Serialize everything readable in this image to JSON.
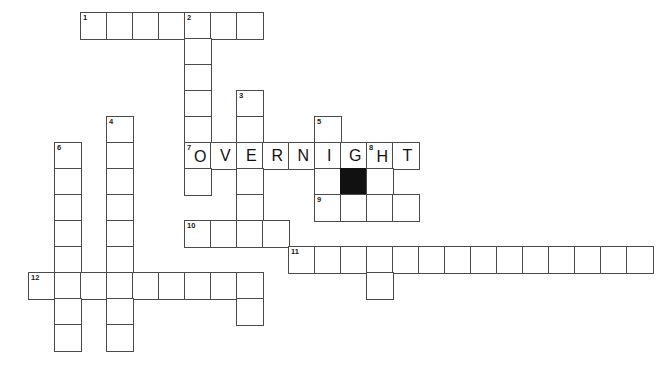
{
  "puzzle": {
    "title": "Crossword Grid",
    "cell_size": 26,
    "origin_x": 28,
    "origin_y": 12,
    "grid_cols": 24,
    "grid_rows": 14,
    "background_color": "#ffffff",
    "line_color": "#4a4a4a",
    "block_color": "#111111",
    "filled_answer": "OVERNIGHT",
    "cells": [
      {
        "c": 2,
        "r": 0,
        "num": "1",
        "letter": ""
      },
      {
        "c": 3,
        "r": 0,
        "num": "",
        "letter": ""
      },
      {
        "c": 4,
        "r": 0,
        "num": "",
        "letter": ""
      },
      {
        "c": 5,
        "r": 0,
        "num": "",
        "letter": ""
      },
      {
        "c": 6,
        "r": 0,
        "num": "2",
        "letter": ""
      },
      {
        "c": 7,
        "r": 0,
        "num": "",
        "letter": ""
      },
      {
        "c": 8,
        "r": 0,
        "num": "",
        "letter": ""
      },
      {
        "c": 6,
        "r": 1,
        "num": "",
        "letter": ""
      },
      {
        "c": 6,
        "r": 2,
        "num": "",
        "letter": ""
      },
      {
        "c": 8,
        "r": 3,
        "num": "3",
        "letter": ""
      },
      {
        "c": 6,
        "r": 3,
        "num": "",
        "letter": ""
      },
      {
        "c": 3,
        "r": 4,
        "num": "4",
        "letter": ""
      },
      {
        "c": 6,
        "r": 4,
        "num": "",
        "letter": ""
      },
      {
        "c": 8,
        "r": 4,
        "num": "",
        "letter": ""
      },
      {
        "c": 11,
        "r": 4,
        "num": "5",
        "letter": ""
      },
      {
        "c": 1,
        "r": 5,
        "num": "6",
        "letter": ""
      },
      {
        "c": 3,
        "r": 5,
        "num": "",
        "letter": ""
      },
      {
        "c": 6,
        "r": 5,
        "num": "7",
        "letter": "O"
      },
      {
        "c": 7,
        "r": 5,
        "num": "",
        "letter": "V"
      },
      {
        "c": 8,
        "r": 5,
        "num": "",
        "letter": "E"
      },
      {
        "c": 9,
        "r": 5,
        "num": "",
        "letter": "R"
      },
      {
        "c": 10,
        "r": 5,
        "num": "",
        "letter": "N"
      },
      {
        "c": 11,
        "r": 5,
        "num": "",
        "letter": "I"
      },
      {
        "c": 12,
        "r": 5,
        "num": "",
        "letter": "G"
      },
      {
        "c": 13,
        "r": 5,
        "num": "8",
        "letter": "H"
      },
      {
        "c": 14,
        "r": 5,
        "num": "",
        "letter": "T"
      },
      {
        "c": 1,
        "r": 6,
        "num": "",
        "letter": ""
      },
      {
        "c": 3,
        "r": 6,
        "num": "",
        "letter": ""
      },
      {
        "c": 6,
        "r": 6,
        "num": "",
        "letter": ""
      },
      {
        "c": 8,
        "r": 6,
        "num": "",
        "letter": ""
      },
      {
        "c": 11,
        "r": 6,
        "num": "",
        "letter": ""
      },
      {
        "c": 12,
        "r": 6,
        "num": "",
        "letter": "",
        "black": true
      },
      {
        "c": 13,
        "r": 6,
        "num": "",
        "letter": ""
      },
      {
        "c": 1,
        "r": 7,
        "num": "",
        "letter": ""
      },
      {
        "c": 3,
        "r": 7,
        "num": "",
        "letter": ""
      },
      {
        "c": 8,
        "r": 7,
        "num": "",
        "letter": ""
      },
      {
        "c": 11,
        "r": 7,
        "num": "9",
        "letter": ""
      },
      {
        "c": 12,
        "r": 7,
        "num": "",
        "letter": ""
      },
      {
        "c": 13,
        "r": 7,
        "num": "",
        "letter": ""
      },
      {
        "c": 14,
        "r": 7,
        "num": "",
        "letter": ""
      },
      {
        "c": 1,
        "r": 8,
        "num": "",
        "letter": ""
      },
      {
        "c": 3,
        "r": 8,
        "num": "",
        "letter": ""
      },
      {
        "c": 6,
        "r": 8,
        "num": "10",
        "letter": ""
      },
      {
        "c": 7,
        "r": 8,
        "num": "",
        "letter": ""
      },
      {
        "c": 8,
        "r": 8,
        "num": "",
        "letter": ""
      },
      {
        "c": 9,
        "r": 8,
        "num": "",
        "letter": ""
      },
      {
        "c": 1,
        "r": 9,
        "num": "",
        "letter": ""
      },
      {
        "c": 3,
        "r": 9,
        "num": "",
        "letter": ""
      },
      {
        "c": 10,
        "r": 9,
        "num": "11",
        "letter": ""
      },
      {
        "c": 11,
        "r": 9,
        "num": "",
        "letter": ""
      },
      {
        "c": 12,
        "r": 9,
        "num": "",
        "letter": ""
      },
      {
        "c": 13,
        "r": 9,
        "num": "",
        "letter": ""
      },
      {
        "c": 14,
        "r": 9,
        "num": "",
        "letter": ""
      },
      {
        "c": 15,
        "r": 9,
        "num": "",
        "letter": ""
      },
      {
        "c": 16,
        "r": 9,
        "num": "",
        "letter": ""
      },
      {
        "c": 17,
        "r": 9,
        "num": "",
        "letter": ""
      },
      {
        "c": 18,
        "r": 9,
        "num": "",
        "letter": ""
      },
      {
        "c": 19,
        "r": 9,
        "num": "",
        "letter": ""
      },
      {
        "c": 20,
        "r": 9,
        "num": "",
        "letter": ""
      },
      {
        "c": 21,
        "r": 9,
        "num": "",
        "letter": ""
      },
      {
        "c": 22,
        "r": 9,
        "num": "",
        "letter": ""
      },
      {
        "c": 23,
        "r": 9,
        "num": "",
        "letter": ""
      },
      {
        "c": 0,
        "r": 10,
        "num": "12",
        "letter": ""
      },
      {
        "c": 1,
        "r": 10,
        "num": "",
        "letter": ""
      },
      {
        "c": 2,
        "r": 10,
        "num": "",
        "letter": ""
      },
      {
        "c": 3,
        "r": 10,
        "num": "",
        "letter": ""
      },
      {
        "c": 4,
        "r": 10,
        "num": "",
        "letter": ""
      },
      {
        "c": 5,
        "r": 10,
        "num": "",
        "letter": ""
      },
      {
        "c": 6,
        "r": 10,
        "num": "",
        "letter": ""
      },
      {
        "c": 7,
        "r": 10,
        "num": "",
        "letter": ""
      },
      {
        "c": 8,
        "r": 10,
        "num": "",
        "letter": ""
      },
      {
        "c": 13,
        "r": 10,
        "num": "",
        "letter": ""
      },
      {
        "c": 1,
        "r": 11,
        "num": "",
        "letter": ""
      },
      {
        "c": 3,
        "r": 11,
        "num": "",
        "letter": ""
      },
      {
        "c": 8,
        "r": 11,
        "num": "",
        "letter": ""
      },
      {
        "c": 1,
        "r": 12,
        "num": "",
        "letter": ""
      },
      {
        "c": 3,
        "r": 12,
        "num": "",
        "letter": ""
      }
    ]
  }
}
